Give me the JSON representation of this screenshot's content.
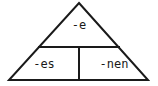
{
  "figure": {
    "type": "triangle-diagram",
    "background_color": "#ffffff",
    "stroke_color": "#1a1a1a",
    "stroke_width": 2,
    "text_color": "#1a1a1a",
    "geometry": {
      "apex": [
        79,
        3
      ],
      "base_left": [
        9,
        80
      ],
      "base_right": [
        148,
        80
      ],
      "horizontal_divider": {
        "y": 47,
        "x_start": 38,
        "x_end": 120
      },
      "vertical_divider": {
        "x": 79,
        "y_start": 47,
        "y_end": 80
      }
    },
    "sections": [
      {
        "id": "top",
        "label": "-e",
        "position": "apex-section"
      },
      {
        "id": "bottom-left",
        "label": "-es",
        "position": "lower-left-cell"
      },
      {
        "id": "bottom-right",
        "label": "-nen",
        "position": "lower-right-cell"
      }
    ]
  }
}
